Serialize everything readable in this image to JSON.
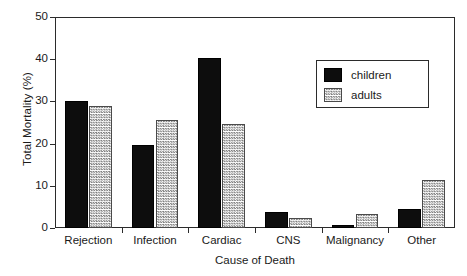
{
  "chart_data": {
    "type": "bar",
    "title": "",
    "subtitle": "",
    "xlabel": "Cause of Death",
    "ylabel": "Total Mortality (%)",
    "categories": [
      "Rejection",
      "Infection",
      "Cardiac",
      "CNS",
      "Malignancy",
      "Other"
    ],
    "series": [
      {
        "name": "children",
        "values": [
          30.2,
          19.7,
          40.4,
          3.8,
          0.8,
          4.6
        ]
      },
      {
        "name": "adults",
        "values": [
          28.8,
          25.6,
          24.6,
          2.4,
          3.4,
          11.3
        ]
      }
    ],
    "ylim": [
      0,
      50
    ],
    "yticks": [
      0,
      10,
      20,
      30,
      40,
      50
    ],
    "ytick_labels": [
      "0",
      "10",
      "20",
      "30",
      "40",
      "50"
    ],
    "grid": false,
    "legend": {
      "position": "upper-right-inset",
      "entries": [
        {
          "label": "children",
          "swatch": "solid-black",
          "color": "#0d0d0d"
        },
        {
          "label": "adults",
          "swatch": "checkered-gray",
          "color": "#7d7d7d"
        }
      ]
    },
    "frame": {
      "visible": true,
      "color": "#2b2b2b"
    }
  }
}
